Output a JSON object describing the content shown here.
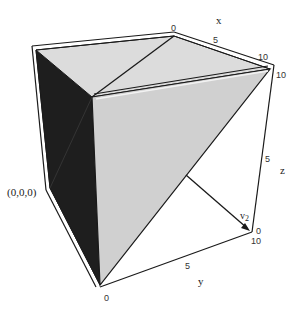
{
  "diagram": {
    "type": "3d-polyhedron-in-bounding-box",
    "colors": {
      "dark_face": "#1e1e1e",
      "light_face": "#d2d2d2",
      "top_face": "#dcdcdc",
      "edge": "#1a1a1a",
      "background": "#ffffff"
    },
    "axes": {
      "x": {
        "label": "x",
        "ticks": [
          "0",
          "5",
          "10"
        ]
      },
      "y": {
        "label": "y",
        "ticks": [
          "0",
          "5",
          "10"
        ]
      },
      "z": {
        "label": "z",
        "ticks": [
          "0",
          "5",
          "10"
        ]
      }
    },
    "annotations": {
      "origin": "(0,0,0)",
      "vector": "v",
      "vector_subscript": "2"
    }
  }
}
